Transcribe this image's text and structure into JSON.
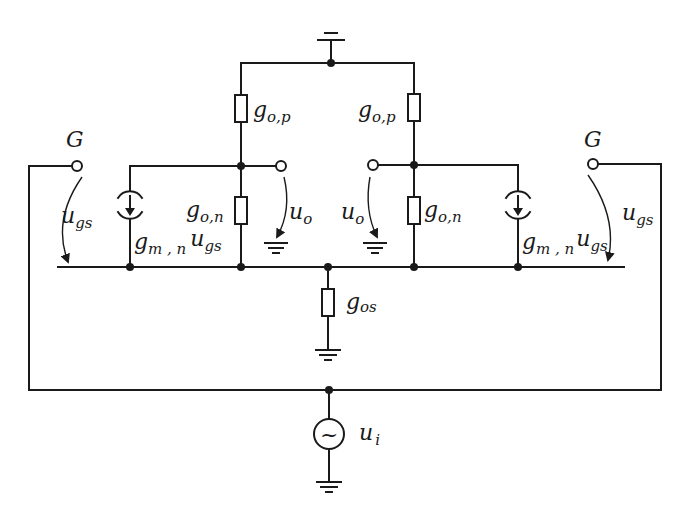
{
  "diagram": {
    "type": "small-signal equivalent circuit",
    "labels": {
      "gate_left": "G",
      "gate_right": "G",
      "ugs_left": {
        "main": "u",
        "sub": "gs"
      },
      "ugs_right": {
        "main": "u",
        "sub": "gs"
      },
      "gop_left": {
        "main": "g",
        "sub": "o,p"
      },
      "gop_right": {
        "main": "g",
        "sub": "o,p"
      },
      "gon_left": {
        "main": "g",
        "sub": "o,n"
      },
      "gon_right": {
        "main": "g",
        "sub": "o,n"
      },
      "uo_left": {
        "main": "u",
        "sub": "o"
      },
      "uo_right": {
        "main": "u",
        "sub": "o"
      },
      "gm_left": {
        "main": "g",
        "sub": "m , n",
        "tail_main": "u",
        "tail_sub": "gs"
      },
      "gm_right": {
        "main": "g",
        "sub": "m , n",
        "tail_main": "u",
        "tail_sub": "gs"
      },
      "gos": {
        "main": "g",
        "sub": "os"
      },
      "ui": {
        "main": "u",
        "sub": "i"
      },
      "source_symbol": "~"
    },
    "colors": {
      "line": "#1a1a1a",
      "background": "#ffffff"
    }
  }
}
